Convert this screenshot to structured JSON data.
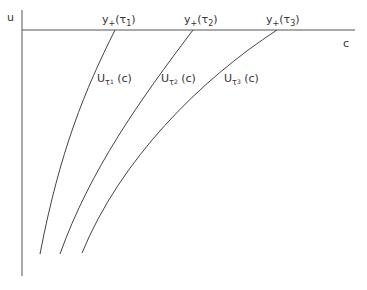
{
  "diagram": {
    "axes": {
      "vertical_label": "u",
      "horizontal_label": "c"
    },
    "top_labels": [
      {
        "prefix": "y",
        "sub": "+",
        "arg_open": "(",
        "tau": "τ",
        "tau_sub": "1",
        "arg_close": ")"
      },
      {
        "prefix": "y",
        "sub": "+",
        "arg_open": "(",
        "tau": "τ",
        "tau_sub": "2",
        "arg_close": ")"
      },
      {
        "prefix": "y",
        "sub": "+",
        "arg_open": "(",
        "tau": "τ",
        "tau_sub": "3",
        "arg_close": ")"
      }
    ],
    "curve_labels": [
      {
        "prefix": "U",
        "tau": "τ",
        "tau_sub": "1",
        "arg": "(c)"
      },
      {
        "prefix": "U",
        "tau": "τ",
        "tau_sub": "2",
        "arg": "(c)"
      },
      {
        "prefix": "U",
        "tau": "τ",
        "tau_sub": "3",
        "arg": "(c)"
      }
    ],
    "colors": {
      "stroke": "#444444",
      "text": "#333333"
    }
  }
}
